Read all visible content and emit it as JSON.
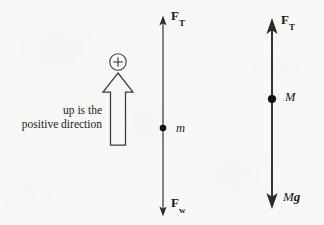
{
  "figure": {
    "background_color": "#f8f8f6",
    "ink_color": "#1a1a1a"
  },
  "caption": {
    "line1": "up is the",
    "line2": "positive direction",
    "full_text": "up is the positive direction"
  },
  "sign_convention": {
    "plus_symbol": "+",
    "arrow_direction": "up",
    "arrow_style": "hollow-outline-block-arrow"
  },
  "diagrams": [
    {
      "id": "left-diagram",
      "name": "small-mass-free-body-diagram",
      "axis_x": 163,
      "body": {
        "dot_label": "m",
        "dot_style": "filled-circle",
        "dot_x": 163,
        "dot_y": 128
      },
      "vectors": [
        {
          "name": "tension-up",
          "label": "F",
          "subscript": "T",
          "direction": "up",
          "head": "small",
          "tip_y": 20
        },
        {
          "name": "weight-down",
          "label": "F",
          "subscript": "w",
          "direction": "down",
          "head": "small",
          "tip_y": 212
        }
      ]
    },
    {
      "id": "right-diagram",
      "name": "large-mass-free-body-diagram",
      "axis_x": 272,
      "body": {
        "dot_label": "M",
        "dot_style": "filled-circle",
        "dot_x": 272,
        "dot_y": 99
      },
      "vectors": [
        {
          "name": "tension-up",
          "label": "F",
          "subscript": "T",
          "direction": "up",
          "head": "large",
          "tip_y": 24
        },
        {
          "name": "weight-down",
          "label_italic": "M",
          "label_bold": "g",
          "direction": "down",
          "head": "large",
          "tip_y": 202
        }
      ]
    }
  ]
}
